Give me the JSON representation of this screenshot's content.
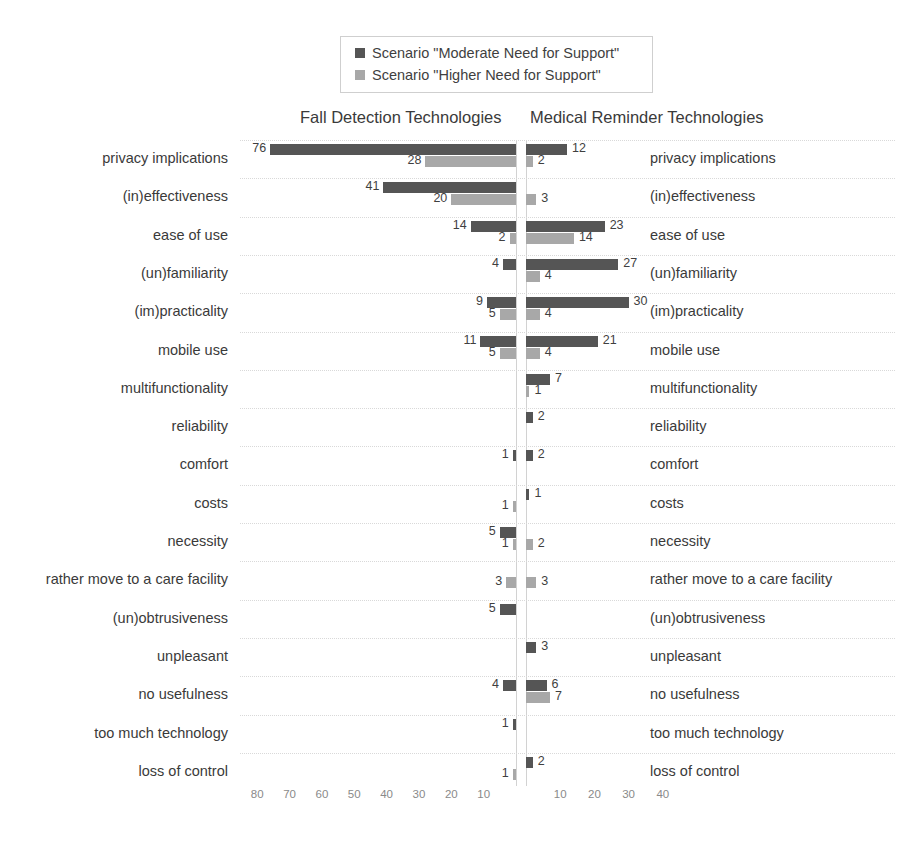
{
  "legend": {
    "items": [
      {
        "label": "Scenario \"Moderate Need for Support\"",
        "color": "#555555",
        "icon": "square-swatch-dark"
      },
      {
        "label": "Scenario \"Higher Need for Support\"",
        "color": "#a8a8a8",
        "icon": "square-swatch-light"
      }
    ]
  },
  "headers": {
    "left": "Fall Detection Technologies",
    "right": "Medical Reminder Technologies"
  },
  "chart_data": {
    "type": "bar",
    "subtype": "tornado-diverging-horizontal",
    "title": "",
    "xlabel": "",
    "ylabel": "",
    "grid": true,
    "legend_position": "top-center",
    "panels": [
      {
        "name": "Fall Detection Technologies",
        "direction": "left",
        "axis_ticks": [
          80,
          70,
          60,
          50,
          40,
          30,
          20,
          10
        ],
        "xlim": [
          0,
          85
        ]
      },
      {
        "name": "Medical Reminder Technologies",
        "direction": "right",
        "axis_ticks": [
          10,
          20,
          30,
          40
        ],
        "xlim": [
          0,
          45
        ]
      }
    ],
    "categories": [
      "privacy implications",
      "(in)effectiveness",
      "ease of use",
      "(un)familiarity",
      "(im)practicality",
      "mobile use",
      "multifunctionality",
      "reliability",
      "comfort",
      "costs",
      "necessity",
      "rather move to a care facility",
      "(un)obtrusiveness",
      "unpleasant",
      "no usefulness",
      "too much technology",
      "loss of control"
    ],
    "series": [
      {
        "name": "Scenario \"Moderate Need for Support\"",
        "panel": "Fall Detection Technologies",
        "color": "#555555",
        "values": [
          76,
          41,
          14,
          4,
          9,
          11,
          null,
          null,
          1,
          null,
          5,
          null,
          5,
          null,
          4,
          1,
          null
        ]
      },
      {
        "name": "Scenario \"Higher Need for Support\"",
        "panel": "Fall Detection Technologies",
        "color": "#a8a8a8",
        "values": [
          28,
          20,
          2,
          null,
          5,
          5,
          null,
          null,
          null,
          1,
          1,
          3,
          null,
          null,
          null,
          null,
          1
        ]
      },
      {
        "name": "Scenario \"Moderate Need for Support\"",
        "panel": "Medical Reminder Technologies",
        "color": "#555555",
        "values": [
          12,
          null,
          23,
          27,
          30,
          21,
          7,
          2,
          2,
          1,
          null,
          null,
          null,
          3,
          6,
          null,
          2
        ]
      },
      {
        "name": "Scenario \"Higher Need for Support\"",
        "panel": "Medical Reminder Technologies",
        "color": "#a8a8a8",
        "values": [
          2,
          3,
          14,
          4,
          4,
          4,
          1,
          null,
          null,
          null,
          2,
          3,
          null,
          null,
          7,
          null,
          null
        ]
      }
    ]
  },
  "axis": {
    "left_ticks": [
      "80",
      "70",
      "60",
      "50",
      "40",
      "30",
      "20",
      "10"
    ],
    "right_ticks": [
      "10",
      "20",
      "30",
      "40"
    ]
  }
}
